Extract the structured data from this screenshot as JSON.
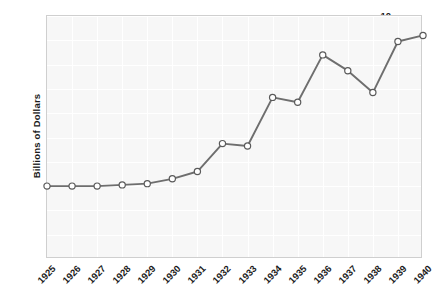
{
  "chart_data": {
    "type": "line",
    "title": "",
    "xlabel": "",
    "ylabel": "Billions of Dollars",
    "categories": [
      "1925",
      "1926",
      "1927",
      "1928",
      "1929",
      "1930",
      "1931",
      "1932",
      "1933",
      "1934",
      "1935",
      "1936",
      "1937",
      "1938",
      "1939",
      "1940"
    ],
    "values": [
      3.0,
      3.0,
      3.0,
      3.05,
      3.1,
      3.3,
      3.6,
      4.75,
      4.65,
      6.65,
      6.45,
      8.4,
      7.75,
      6.85,
      8.95,
      9.2
    ],
    "series": [
      {
        "name": "Billions of Dollars",
        "values": [
          3.0,
          3.0,
          3.0,
          3.05,
          3.1,
          3.3,
          3.6,
          4.75,
          4.65,
          6.65,
          6.45,
          8.4,
          7.75,
          6.85,
          8.95,
          9.2
        ]
      }
    ],
    "ylim": [
      0,
      10
    ],
    "yticks": [
      10,
      9,
      8,
      7,
      6,
      5,
      4,
      3,
      2,
      1
    ],
    "grid": true,
    "legend": "none",
    "marker": "circle-open",
    "line_color": "#6e6e6e",
    "marker_fill": "#ffffff",
    "marker_edge": "#5a5a5a",
    "plot_background": "#f7f7f7",
    "grid_color": "#ffffff",
    "border_color": "#cfcfcf",
    "text_color": "#1b1b1b"
  }
}
